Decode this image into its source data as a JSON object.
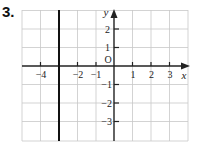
{
  "problem": {
    "number": "3."
  },
  "graph": {
    "x_axis_label": "x",
    "y_axis_label": "y",
    "origin_label": "O",
    "x_ticks": [
      {
        "value": -4,
        "label": "−4"
      },
      {
        "value": -2,
        "label": "−2"
      },
      {
        "value": -1,
        "label": "−1"
      },
      {
        "value": 1,
        "label": "1"
      },
      {
        "value": 2,
        "label": "2"
      },
      {
        "value": 3,
        "label": "3"
      }
    ],
    "y_ticks": [
      {
        "value": 2,
        "label": "2"
      },
      {
        "value": 1,
        "label": "1"
      },
      {
        "value": -1,
        "label": "−1"
      },
      {
        "value": -2,
        "label": "−2"
      },
      {
        "value": -3,
        "label": "−3"
      }
    ],
    "x_range": [
      -5,
      4
    ],
    "y_range": [
      -4,
      3
    ],
    "plotted_line": {
      "equation": "x = -3",
      "type": "vertical",
      "x": -3
    },
    "colors": {
      "grid": "#c8c8c8",
      "axis": "#222222",
      "line": "#111111"
    }
  }
}
